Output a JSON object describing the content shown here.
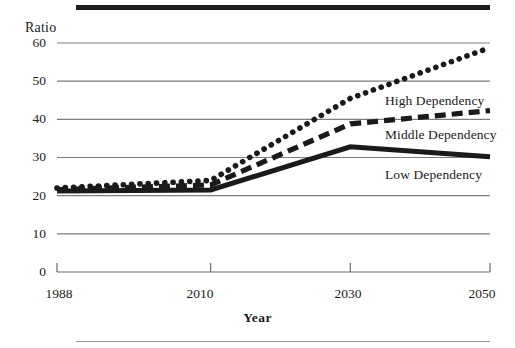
{
  "figure": {
    "top_rule_color": "#1c1c1c",
    "bottom_rule_color": "#9a9a9a",
    "background": "#ffffff"
  },
  "axis": {
    "y_title": "Ratio",
    "x_title": "Year",
    "y_ticks": [
      "0",
      "10",
      "20",
      "30",
      "40",
      "50",
      "60"
    ],
    "x_ticks": [
      "1988",
      "2010",
      "2030",
      "2050"
    ],
    "gridline_color": "#7d7d7d",
    "axis_color": "#6b6b6b"
  },
  "series_labels": {
    "high": "High Dependency",
    "middle": "Middle Dependency",
    "low": "Low Dependency"
  },
  "chart_data": {
    "type": "line",
    "title": "",
    "xlabel": "Year",
    "ylabel": "Ratio",
    "xlim": [
      1988,
      2050
    ],
    "ylim": [
      0,
      60
    ],
    "ytick_values": [
      0,
      10,
      20,
      30,
      40,
      50,
      60
    ],
    "xtick_values": [
      1988,
      2010,
      2030,
      2050
    ],
    "grid": "horizontal",
    "legend": "inline-right",
    "x": [
      1988,
      2010,
      2030,
      2050
    ],
    "series": [
      {
        "name": "High Dependency",
        "style": "dotted",
        "color": "#1a1a1a",
        "values": [
          22.0,
          24.0,
          45.5,
          58.8
        ]
      },
      {
        "name": "Middle Dependency",
        "style": "dashed",
        "color": "#1a1a1a",
        "values": [
          21.6,
          22.8,
          38.8,
          42.3
        ]
      },
      {
        "name": "Low Dependency",
        "style": "solid",
        "color": "#1a1a1a",
        "values": [
          21.2,
          21.5,
          32.8,
          30.2
        ]
      }
    ]
  }
}
